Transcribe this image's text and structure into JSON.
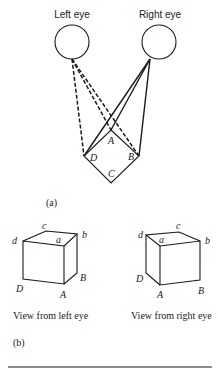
{
  "diagram": {
    "part_a": {
      "eyes": [
        {
          "label": "Left eye",
          "cx": 72,
          "cy": 42,
          "r": 17
        },
        {
          "label": "Right eye",
          "cx": 159,
          "cy": 42,
          "r": 17
        }
      ],
      "square_vertices": {
        "A": "A",
        "B": "B",
        "C": "C",
        "D": "D"
      },
      "caption": "(a)"
    },
    "part_b": {
      "left_cube": {
        "vertex_labels": {
          "a": "a",
          "b": "b",
          "c": "c",
          "d": "d",
          "A": "A",
          "B": "B",
          "D": "D"
        },
        "caption": "View from left eye"
      },
      "right_cube": {
        "vertex_labels": {
          "a": "a",
          "b": "b",
          "c": "c",
          "d": "d",
          "A": "A",
          "B": "B",
          "D": "D"
        },
        "caption": "View from right eye"
      },
      "caption": "(b)"
    }
  }
}
